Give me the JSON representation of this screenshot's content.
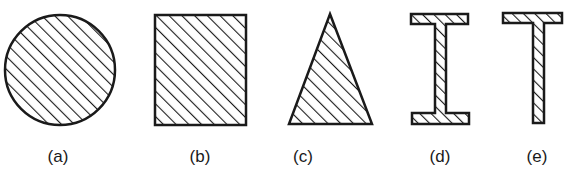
{
  "figure": {
    "shapes": [
      {
        "id": "a",
        "label": "(a)",
        "shape": "circle"
      },
      {
        "id": "b",
        "label": "(b)",
        "shape": "rectangle"
      },
      {
        "id": "c",
        "label": "(c)",
        "shape": "triangle"
      },
      {
        "id": "d",
        "label": "(d)",
        "shape": "I-beam"
      },
      {
        "id": "e",
        "label": "(e)",
        "shape": "T-beam"
      }
    ],
    "fill_pattern": "diagonal-hatch",
    "stroke_color": "#1a1a1a",
    "background_color": "#ffffff"
  }
}
